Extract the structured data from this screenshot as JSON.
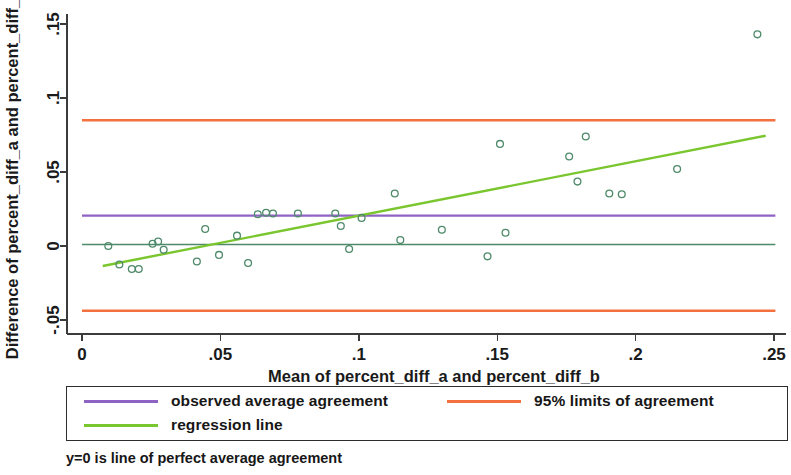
{
  "figure": {
    "title": "",
    "footnote": "y=0 is line of perfect average agreement"
  },
  "axes": {
    "x_title": "Mean of percent_diff_a and percent_diff_b",
    "y_title": "Difference of percent_diff_a and percent_diff_b",
    "x_ticks": [
      "0",
      ".05",
      ".1",
      ".15",
      ".2",
      ".25"
    ],
    "y_ticks": [
      "-.05",
      "0",
      ".05",
      ".1",
      ".15"
    ]
  },
  "legend": {
    "entries": [
      {
        "label": "observed average agreement",
        "color": "#8f63c4"
      },
      {
        "label": "95% limits of agreement",
        "color": "#f4713f"
      },
      {
        "label": "regression line",
        "color": "#7ac62f"
      }
    ]
  },
  "colors": {
    "observed_average": "#8f63c4",
    "limits_of_agreement": "#f4713f",
    "regression": "#7ac62f",
    "zero_line": "#4e8a6a",
    "marker": "#4e8a6a",
    "axis": "#3b3b3b",
    "background": "#ffffff"
  },
  "chart_data": {
    "type": "scatter",
    "title": "",
    "subtitle": "",
    "xlabel": "Mean of percent_diff_a and percent_diff_b",
    "ylabel": "Difference of percent_diff_a and percent_diff_b",
    "xlim": [
      0,
      0.25
    ],
    "ylim": [
      -0.05,
      0.15
    ],
    "xticks": [
      0,
      0.05,
      0.1,
      0.15,
      0.2,
      0.25
    ],
    "yticks": [
      -0.05,
      0,
      0.05,
      0.1,
      0.15
    ],
    "xtick_labels": [
      "0",
      ".05",
      ".1",
      ".15",
      ".2",
      ".25"
    ],
    "ytick_labels": [
      "-.05",
      "0",
      ".05",
      ".1",
      ".15"
    ],
    "grid": false,
    "legend_position": "below-axes",
    "marker_style": "open-circle",
    "series": [
      {
        "name": "differences",
        "type": "scatter",
        "points": [
          [
            0.0095,
            0.0
          ],
          [
            0.0135,
            -0.0125
          ],
          [
            0.018,
            -0.0155
          ],
          [
            0.0205,
            -0.0155
          ],
          [
            0.0255,
            0.0015
          ],
          [
            0.0275,
            0.003
          ],
          [
            0.0295,
            -0.0025
          ],
          [
            0.0415,
            -0.0105
          ],
          [
            0.0445,
            0.0115
          ],
          [
            0.0495,
            -0.006
          ],
          [
            0.056,
            0.007
          ],
          [
            0.06,
            -0.0115
          ],
          [
            0.0635,
            0.0215
          ],
          [
            0.0665,
            0.0225
          ],
          [
            0.069,
            0.022
          ],
          [
            0.078,
            0.022
          ],
          [
            0.0915,
            0.022
          ],
          [
            0.0935,
            0.0135
          ],
          [
            0.0965,
            -0.002
          ],
          [
            0.101,
            0.019
          ],
          [
            0.113,
            0.0355
          ],
          [
            0.115,
            0.004
          ],
          [
            0.13,
            0.011
          ],
          [
            0.1465,
            -0.007
          ],
          [
            0.151,
            0.069
          ],
          [
            0.153,
            0.009
          ],
          [
            0.176,
            0.0605
          ],
          [
            0.179,
            0.0435
          ],
          [
            0.182,
            0.074
          ],
          [
            0.1905,
            0.0355
          ],
          [
            0.195,
            0.035
          ],
          [
            0.215,
            0.052
          ],
          [
            0.244,
            0.143
          ]
        ]
      },
      {
        "name": "observed average agreement",
        "type": "line",
        "y_value": 0.0205,
        "x_range": [
          0.0,
          0.2505
        ]
      },
      {
        "name": "95% upper limit of agreement",
        "type": "line",
        "y_value": 0.085,
        "x_range": [
          0.0,
          0.2505
        ]
      },
      {
        "name": "95% lower limit of agreement",
        "type": "line",
        "y_value": -0.0437,
        "x_range": [
          0.0,
          0.2505
        ]
      },
      {
        "name": "zero line (perfect average agreement)",
        "type": "line",
        "y_value": 0.001,
        "x_range": [
          0.0,
          0.2505
        ]
      },
      {
        "name": "regression line",
        "type": "line",
        "endpoints": [
          [
            0.0075,
            -0.0135
          ],
          [
            0.247,
            0.0745
          ]
        ]
      }
    ]
  }
}
